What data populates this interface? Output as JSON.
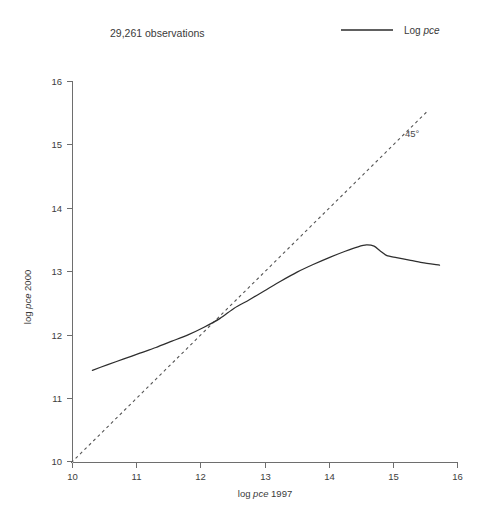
{
  "chart_data": {
    "type": "line",
    "title": "",
    "xlabel": "log pce 1997",
    "ylabel": "log pce 2000",
    "xlim": [
      10,
      16
    ],
    "ylim": [
      10,
      16
    ],
    "grid": false,
    "legend_position": "top-right",
    "annotations": [
      {
        "id": "observations",
        "text": "29,261 observations",
        "x": 0.17,
        "y": 0.95
      },
      {
        "id": "diagonal-label",
        "text": "45°",
        "x": 14.5,
        "y": 15.1
      }
    ],
    "xticks": [
      10,
      11,
      12,
      13,
      14,
      15,
      16
    ],
    "xtick_labels": [
      "10",
      "11",
      "12",
      "13",
      "14",
      "15",
      "16"
    ],
    "yticks": [
      10,
      11,
      12,
      13,
      14,
      15,
      16
    ],
    "ytick_labels": [
      "10",
      "11",
      "12",
      "13",
      "14",
      "15",
      "16"
    ],
    "series": [
      {
        "name": "Log pce",
        "style": "solid",
        "color": "#2e2e2e",
        "x": [
          10.31,
          10.55,
          10.8,
          11.05,
          11.3,
          11.55,
          11.8,
          12.05,
          12.3,
          12.52,
          12.75,
          13.0,
          13.25,
          13.5,
          13.75,
          14.0,
          14.25,
          14.45,
          14.58,
          14.7,
          14.8,
          14.9,
          15.05,
          15.25,
          15.45,
          15.72
        ],
        "y": [
          11.44,
          11.53,
          11.62,
          11.71,
          11.8,
          11.9,
          12.0,
          12.12,
          12.26,
          12.42,
          12.55,
          12.7,
          12.85,
          12.99,
          13.11,
          13.22,
          13.32,
          13.39,
          13.42,
          13.4,
          13.32,
          13.25,
          13.22,
          13.18,
          13.14,
          13.1
        ]
      },
      {
        "name": "45°",
        "style": "dashed",
        "color": "#555555",
        "x": [
          9.98,
          15.52
        ],
        "y": [
          9.98,
          15.52
        ]
      }
    ],
    "legend": [
      {
        "label_prefix": "Log ",
        "label_italic": "pce",
        "style": "solid",
        "color": "#2b2b2b"
      }
    ]
  },
  "axes": {
    "x_title_prefix": "log ",
    "x_title_italic": "pce",
    "x_title_suffix": " 1997",
    "y_title_prefix": "log ",
    "y_title_italic": "pce",
    "y_title_suffix": " 2000"
  },
  "colors": {
    "series": "#2e2e2e",
    "reference": "#555555",
    "axis": "#6e6e6e",
    "text": "#3a3a3a",
    "background": "#ffffff"
  }
}
